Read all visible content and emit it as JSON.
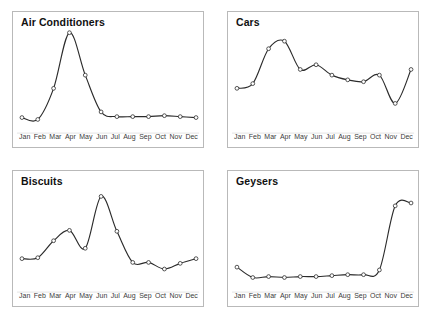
{
  "figure": {
    "panel_border_color": "#b9b9b9",
    "line_color": "#2b2b2b",
    "marker_fill": "#ffffff",
    "baseline_color": "#d8d8d8",
    "background": "#ffffff"
  },
  "chart_data": [
    {
      "type": "line",
      "title": "Air Conditioners",
      "xlabel": "",
      "ylabel": "",
      "grid": false,
      "legend": "none",
      "categories": [
        "Jan",
        "Feb",
        "Mar",
        "Apr",
        "May",
        "Jun",
        "Jul",
        "Aug",
        "Sep",
        "Oct",
        "Nov",
        "Dec"
      ],
      "values": [
        7,
        5,
        38,
        97,
        52,
        13,
        8,
        8,
        8,
        9,
        8,
        7
      ],
      "ylim": [
        0,
        100
      ]
    },
    {
      "type": "line",
      "title": "Cars",
      "xlabel": "",
      "ylabel": "",
      "grid": false,
      "legend": "none",
      "categories": [
        "Jan",
        "Feb",
        "Mar",
        "Apr",
        "May",
        "Jun",
        "Jul",
        "Aug",
        "Sep",
        "Oct",
        "Nov",
        "Dec"
      ],
      "values": [
        38,
        43,
        80,
        88,
        58,
        63,
        52,
        47,
        45,
        52,
        22,
        58
      ],
      "ylim": [
        0,
        100
      ]
    },
    {
      "type": "line",
      "title": "Biscuits",
      "xlabel": "",
      "ylabel": "",
      "grid": false,
      "legend": "none",
      "categories": [
        "Jan",
        "Feb",
        "Mar",
        "Apr",
        "May",
        "Jun",
        "Jul",
        "Aug",
        "Sep",
        "Oct",
        "Nov",
        "Dec"
      ],
      "values": [
        26,
        27,
        45,
        56,
        37,
        92,
        55,
        22,
        22,
        15,
        21,
        26
      ],
      "ylim": [
        0,
        100
      ]
    },
    {
      "type": "line",
      "title": "Geysers",
      "xlabel": "",
      "ylabel": "",
      "grid": false,
      "legend": "none",
      "categories": [
        "Jan",
        "Feb",
        "Mar",
        "Apr",
        "May",
        "Jun",
        "Jul",
        "Aug",
        "Sep",
        "Oct",
        "Nov",
        "Dec"
      ],
      "values": [
        17,
        6,
        7,
        6,
        7,
        7,
        8,
        9,
        9,
        14,
        82,
        85
      ],
      "ylim": [
        0,
        100
      ]
    }
  ],
  "panels": [
    {
      "title": "Air Conditioners",
      "index": 0
    },
    {
      "title": "Cars",
      "index": 1
    },
    {
      "title": "Biscuits",
      "index": 2
    },
    {
      "title": "Geysers",
      "index": 3
    }
  ]
}
